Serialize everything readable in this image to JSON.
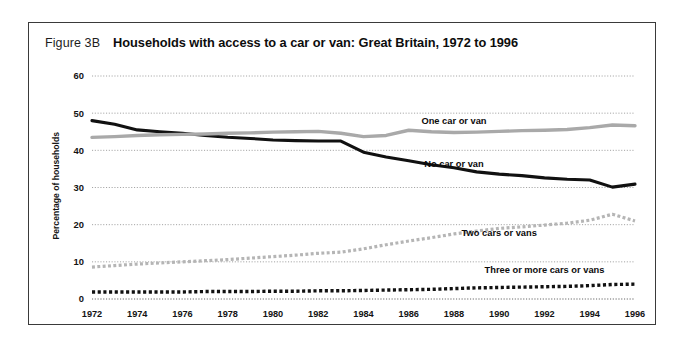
{
  "figure": {
    "number": "Figure 3B",
    "title": "Households with access to a car or van: Great Britain, 1972 to 1996"
  },
  "chart_data": {
    "type": "line",
    "title": "Households with access to a car or van: Great Britain, 1972 to 1996",
    "xlabel": "",
    "ylabel": "Percentage of households",
    "xlim": [
      1972,
      1996
    ],
    "ylim": [
      0,
      60
    ],
    "ytick_values": [
      0,
      10,
      20,
      30,
      40,
      50,
      60
    ],
    "ytick_labels": [
      "0",
      "10",
      "20",
      "30",
      "40",
      "50",
      "60"
    ],
    "xtick_values": [
      1972,
      1974,
      1976,
      1978,
      1980,
      1982,
      1984,
      1986,
      1988,
      1990,
      1992,
      1994,
      1996
    ],
    "xtick_labels": [
      "1972",
      "1974",
      "1976",
      "1978",
      "1980",
      "1982",
      "1984",
      "1986",
      "1988",
      "1990",
      "1992",
      "1994",
      "1996"
    ],
    "grid": true,
    "legend_position": "inline-labels",
    "x": [
      1972,
      1973,
      1974,
      1975,
      1976,
      1977,
      1978,
      1979,
      1980,
      1981,
      1982,
      1983,
      1984,
      1985,
      1986,
      1987,
      1988,
      1989,
      1990,
      1991,
      1992,
      1993,
      1994,
      1995,
      1996
    ],
    "series": [
      {
        "name": "No car or van",
        "label": "No car or van",
        "color": "#111111",
        "style": "solid",
        "width": 3.1,
        "values": [
          48.0,
          47.0,
          45.5,
          45.0,
          44.6,
          44.0,
          43.5,
          43.2,
          42.8,
          42.6,
          42.5,
          42.5,
          39.5,
          38.2,
          37.2,
          36.1,
          35.3,
          34.2,
          33.6,
          33.2,
          32.6,
          32.2,
          32.0,
          30.1,
          30.9
        ]
      },
      {
        "name": "One car or van",
        "label": "One car or van",
        "color": "#a9a9a9",
        "style": "solid",
        "width": 3.4,
        "values": [
          43.5,
          43.7,
          44.0,
          44.2,
          44.3,
          44.4,
          44.6,
          44.7,
          44.9,
          45.0,
          45.1,
          44.6,
          43.7,
          44.0,
          45.4,
          45.0,
          44.8,
          44.9,
          45.1,
          45.3,
          45.4,
          45.6,
          46.1,
          46.8,
          46.6
        ]
      },
      {
        "name": "Two cars or vans",
        "label": "Two cars or vans",
        "color": "#b5b5b5",
        "style": "dotted",
        "width": 3.2,
        "values": [
          8.6,
          9.0,
          9.4,
          9.7,
          10.0,
          10.3,
          10.6,
          11.0,
          11.4,
          11.8,
          12.3,
          12.6,
          13.5,
          14.6,
          15.6,
          16.5,
          17.5,
          18.3,
          19.0,
          19.4,
          19.9,
          20.4,
          21.2,
          22.8,
          21.0
        ]
      },
      {
        "name": "Three or more cars or vans",
        "label": "Three or more cars or vans",
        "color": "#111111",
        "style": "dotted",
        "width": 3.4,
        "values": [
          1.9,
          1.9,
          1.9,
          1.9,
          1.9,
          2.0,
          2.0,
          2.0,
          2.1,
          2.1,
          2.2,
          2.2,
          2.3,
          2.4,
          2.5,
          2.6,
          2.8,
          3.0,
          3.1,
          3.2,
          3.3,
          3.4,
          3.6,
          3.9,
          4.0
        ]
      }
    ],
    "annotations": [
      {
        "text": "One car or van",
        "x": 1988,
        "y": 47.0
      },
      {
        "text": "No car or van",
        "x": 1988,
        "y": 35.5
      },
      {
        "text": "Two cars or vans",
        "x": 1990,
        "y": 17.0
      },
      {
        "text": "Three or more cars or vans",
        "x": 1992,
        "y": 7.0
      }
    ]
  }
}
